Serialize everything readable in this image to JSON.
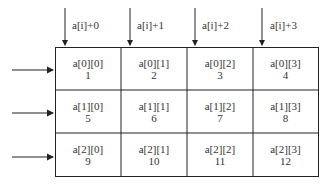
{
  "column_pointers": [
    "a[i]+0",
    "a[i]+1",
    "a[i]+2",
    "a[i]+3"
  ],
  "rows": [
    [
      {
        "name": "a[0][0]",
        "value": "1"
      },
      {
        "name": "a[0][1]",
        "value": "2"
      },
      {
        "name": "a[0][2]",
        "value": "3"
      },
      {
        "name": "a[0][3]",
        "value": "4"
      }
    ],
    [
      {
        "name": "a[1][0]",
        "value": "5"
      },
      {
        "name": "a[1][1]",
        "value": "6"
      },
      {
        "name": "a[1][2]",
        "value": "7"
      },
      {
        "name": "a[1][3]",
        "value": "8"
      }
    ],
    [
      {
        "name": "a[2][0]",
        "value": "9"
      },
      {
        "name": "a[2][1]",
        "value": "10"
      },
      {
        "name": "a[2][2]",
        "value": "11"
      },
      {
        "name": "a[2][3]",
        "value": "12"
      }
    ]
  ],
  "colors": {
    "line": "#222222",
    "text": "#333333",
    "background": "#ffffff"
  }
}
